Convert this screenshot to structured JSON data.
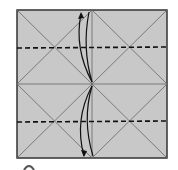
{
  "diagram": {
    "type": "origami-fold-diagram",
    "paper_color": "#c8c8c8",
    "line_color": "#555555",
    "border_color": "#333333",
    "square": {
      "x": 17,
      "y": 10,
      "w": 150,
      "h": 148
    },
    "valley_fold_lines": [
      {
        "y": 48,
        "style": "dashed"
      },
      {
        "y": 122,
        "style": "dashed"
      }
    ],
    "arrows": [
      {
        "direction": "up",
        "from": "center",
        "to": "top-edge"
      },
      {
        "direction": "down",
        "from": "center",
        "to": "bottom-edge"
      }
    ],
    "step_marker": "partially visible circle at bottom-left"
  }
}
